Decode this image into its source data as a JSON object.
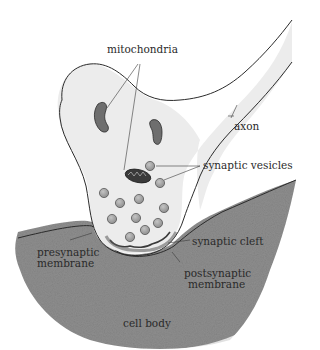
{
  "diagram": {
    "labels": {
      "mitochondria": "mitochondria",
      "axon": "axon",
      "synaptic_vesicles": "synaptic vesicles",
      "synaptic_cleft": "synaptic cleft",
      "presynaptic_membrane_line1": "presynaptic",
      "presynaptic_membrane_line2": "membrane",
      "postsynaptic_membrane_line1": "postsynaptic",
      "postsynaptic_membrane_line2": "membrane",
      "cell_body": "cell body"
    },
    "colors": {
      "terminal_fill": "#ececec",
      "cell_body_fill": "#8c8c8c",
      "mitochondria_fill": "#6e6e6e",
      "mitochondria_dark": "#2a2a2a",
      "vesicle_fill": "#a8a8a8",
      "outline": "#2b2b2b"
    },
    "structures": [
      "axon",
      "axon terminal",
      "mitochondria",
      "synaptic vesicles",
      "synaptic cleft",
      "presynaptic membrane",
      "postsynaptic membrane",
      "cell body"
    ]
  }
}
